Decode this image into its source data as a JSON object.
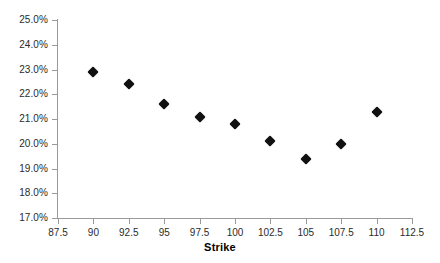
{
  "chart_data": {
    "type": "scatter",
    "title": "",
    "xlabel": "Strike",
    "ylabel": "",
    "xlim": [
      87.5,
      112.5
    ],
    "ylim": [
      0.17,
      0.25
    ],
    "grid": false,
    "legend": false,
    "marker_style": "filled-diamond",
    "marker_color": "#111111",
    "axis_color": "#9a9a9a",
    "x": [
      90,
      92.5,
      95,
      97.5,
      100,
      102.5,
      105,
      107.5,
      110
    ],
    "values": [
      0.229,
      0.224,
      0.216,
      0.211,
      0.208,
      0.201,
      0.194,
      0.2,
      0.213
    ],
    "value_labels": [
      "22.9%",
      "22.4%",
      "21.6%",
      "21.1%",
      "20.8%",
      "20.1%",
      "19.4%",
      "20.0%",
      "21.3%"
    ],
    "xticks": [
      87.5,
      90,
      92.5,
      95,
      97.5,
      100,
      102.5,
      105,
      107.5,
      110,
      112.5
    ],
    "xtick_labels": [
      "87.5",
      "90",
      "92.5",
      "95",
      "97.5",
      "100",
      "102.5",
      "105",
      "107.5",
      "110",
      "112.5"
    ],
    "yticks": [
      0.17,
      0.18,
      0.19,
      0.2,
      0.21,
      0.22,
      0.23,
      0.24,
      0.25
    ],
    "ytick_labels": [
      "17.0%",
      "18.0%",
      "19.0%",
      "20.0%",
      "21.0%",
      "22.0%",
      "23.0%",
      "24.0%",
      "25.0%"
    ]
  }
}
